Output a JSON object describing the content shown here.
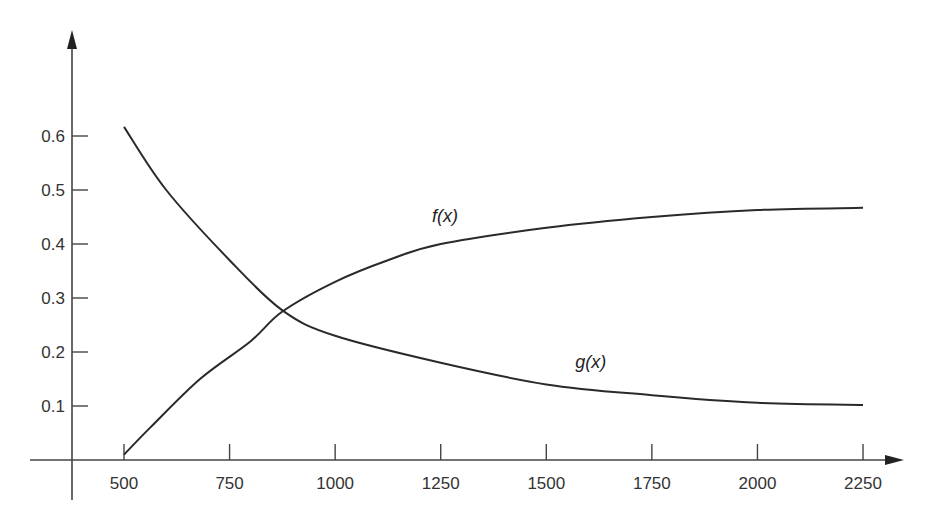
{
  "chart_data": {
    "type": "line",
    "title": "",
    "xlabel": "",
    "ylabel": "",
    "xlim": [
      500,
      2250
    ],
    "ylim": [
      0,
      0.6
    ],
    "grid": false,
    "legend": "inline labels",
    "x_ticks": [
      500,
      750,
      1000,
      1250,
      1500,
      1750,
      2000,
      2250
    ],
    "x_tick_labels": [
      "500",
      "750",
      "1000",
      "1250",
      "1500",
      "1750",
      "2000",
      "2250"
    ],
    "y_ticks": [
      0.1,
      0.2,
      0.3,
      0.4,
      0.5,
      0.6
    ],
    "y_tick_labels": [
      "0.1",
      "0.2",
      "0.3",
      "0.4",
      "0.5",
      "0.6"
    ],
    "series": [
      {
        "name": "f(x)",
        "label_text": "f(x)",
        "label_pos": [
          1260,
          0.44
        ],
        "x": [
          500,
          562,
          680,
          800,
          875,
          1000,
          1125,
          1250,
          1500,
          1750,
          2000,
          2250
        ],
        "values": [
          0.01,
          0.06,
          0.15,
          0.22,
          0.275,
          0.33,
          0.37,
          0.4,
          0.43,
          0.45,
          0.463,
          0.467
        ]
      },
      {
        "name": "g(x)",
        "label_text": "g(x)",
        "label_pos": [
          1605,
          0.17
        ],
        "x": [
          500,
          600,
          750,
          875,
          1000,
          1250,
          1500,
          1750,
          2000,
          2250
        ],
        "values": [
          0.617,
          0.5,
          0.37,
          0.277,
          0.23,
          0.18,
          0.14,
          0.12,
          0.106,
          0.102
        ]
      }
    ],
    "annotations": [
      "curves intersect near x≈875, y≈0.277"
    ]
  },
  "colors": {
    "axis": "#444444",
    "line": "#2a2a2a",
    "text": "#333333"
  }
}
